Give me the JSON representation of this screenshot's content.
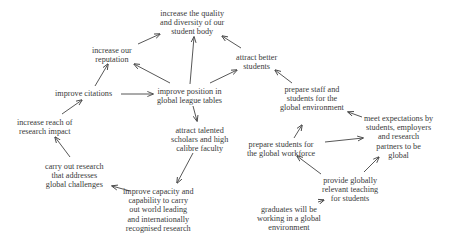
{
  "diagram": {
    "type": "concept-map",
    "nodes": [
      {
        "id": "quality",
        "label": "increase the quality\nand diversity of our\nstudent body",
        "x": 160,
        "y": 9
      },
      {
        "id": "reputation",
        "label": "increase our\nreputation",
        "x": 92,
        "y": 46
      },
      {
        "id": "better_students",
        "label": "attract better\nstudents",
        "x": 236,
        "y": 53
      },
      {
        "id": "citations",
        "label": "improve citations",
        "x": 55,
        "y": 89
      },
      {
        "id": "league",
        "label": "improve position in\nglobal league tables",
        "x": 157,
        "y": 87
      },
      {
        "id": "prepare_staff",
        "label": "prepare staff and\nstudents for the\nglobal environment",
        "x": 280,
        "y": 85
      },
      {
        "id": "reach",
        "label": "increase reach of\nresearch impact",
        "x": 17,
        "y": 118
      },
      {
        "id": "talented",
        "label": "attract talented\nscholars and high\ncalibre faculty",
        "x": 171,
        "y": 126
      },
      {
        "id": "expectations",
        "label": "meet expectations by\nstudents, employers\nand research\npartners to be\nglobal",
        "x": 364,
        "y": 114
      },
      {
        "id": "prepare_workforce",
        "label": "prepare students for\nthe global workforce",
        "x": 247,
        "y": 140
      },
      {
        "id": "research",
        "label": "carry out research\nthat addresses\nglobal challenges",
        "x": 45,
        "y": 162
      },
      {
        "id": "capacity",
        "label": "improve capacity and\ncapability to carry\nout world leading\nand internationally\nrecognised research",
        "x": 123,
        "y": 187
      },
      {
        "id": "teaching",
        "label": "provide globally\nrelevant teaching\nfor students",
        "x": 322,
        "y": 176
      },
      {
        "id": "graduates",
        "label": "graduates will be\nworking in a global\nenvironment",
        "x": 257,
        "y": 205
      }
    ],
    "edges": [
      {
        "from": "reputation",
        "to": "quality",
        "x1": 138,
        "y1": 44,
        "x2": 160,
        "y2": 34
      },
      {
        "from": "league",
        "to": "quality",
        "x1": 190,
        "y1": 84,
        "x2": 194,
        "y2": 37
      },
      {
        "from": "better_students",
        "to": "quality",
        "x1": 241,
        "y1": 48,
        "x2": 222,
        "y2": 36
      },
      {
        "from": "league",
        "to": "reputation",
        "x1": 170,
        "y1": 83,
        "x2": 134,
        "y2": 64
      },
      {
        "from": "league",
        "to": "better_students",
        "x1": 210,
        "y1": 83,
        "x2": 237,
        "y2": 70
      },
      {
        "from": "citations",
        "to": "reputation",
        "x1": 95,
        "y1": 86,
        "x2": 108,
        "y2": 64
      },
      {
        "from": "citations",
        "to": "league",
        "x1": 121,
        "y1": 94,
        "x2": 153,
        "y2": 94
      },
      {
        "from": "prepare_staff",
        "to": "better_students",
        "x1": 292,
        "y1": 83,
        "x2": 275,
        "y2": 70
      },
      {
        "from": "league",
        "to": "talented",
        "x1": 193,
        "y1": 106,
        "x2": 197,
        "y2": 121
      },
      {
        "from": "reach",
        "to": "citations",
        "x1": 62,
        "y1": 114,
        "x2": 82,
        "y2": 100
      },
      {
        "from": "expectations",
        "to": "prepare_staff",
        "x1": 362,
        "y1": 117,
        "x2": 348,
        "y2": 112
      },
      {
        "from": "prepare_workforce",
        "to": "prepare_staff",
        "x1": 294,
        "y1": 138,
        "x2": 302,
        "y2": 125
      },
      {
        "from": "prepare_workforce",
        "to": "expectations",
        "x1": 325,
        "y1": 142,
        "x2": 363,
        "y2": 138
      },
      {
        "from": "research",
        "to": "reach",
        "x1": 70,
        "y1": 157,
        "x2": 55,
        "y2": 137
      },
      {
        "from": "talented",
        "to": "capacity",
        "x1": 193,
        "y1": 153,
        "x2": 177,
        "y2": 183
      },
      {
        "from": "capacity",
        "to": "research",
        "x1": 130,
        "y1": 191,
        "x2": 112,
        "y2": 186
      },
      {
        "from": "teaching",
        "to": "prepare_workforce",
        "x1": 321,
        "y1": 174,
        "x2": 297,
        "y2": 156
      },
      {
        "from": "teaching",
        "to": "expectations",
        "x1": 364,
        "y1": 172,
        "x2": 379,
        "y2": 157
      },
      {
        "from": "graduates",
        "to": "teaching",
        "x1": 318,
        "y1": 202,
        "x2": 324,
        "y2": 200
      }
    ]
  }
}
